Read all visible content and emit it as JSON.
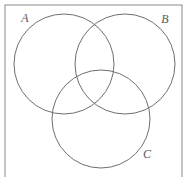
{
  "figure": {
    "background_color": "#ffffff",
    "stroke_color": "#6f6f6f",
    "frame_color": "#8a8a8a",
    "label_color": "#5a5a5a"
  },
  "frame": {
    "x": 5,
    "y": 5,
    "width": 177,
    "height": 176
  },
  "chart_data": {
    "type": "diagram",
    "diagram_kind": "venn",
    "set_count": 3,
    "title": "",
    "xlabel": "",
    "ylabel": "",
    "grid": false,
    "legend": "none",
    "sets": [
      {
        "name": "A",
        "label": "A",
        "cx": 64,
        "cy": 64,
        "r": 50,
        "label_x": 25,
        "label_y": 22
      },
      {
        "name": "B",
        "label": "B",
        "cx": 125,
        "cy": 64,
        "r": 50,
        "label_x": 165,
        "label_y": 23
      },
      {
        "name": "C",
        "label": "C",
        "cx": 101,
        "cy": 119,
        "r": 49,
        "label_x": 147,
        "label_y": 158
      }
    ]
  }
}
